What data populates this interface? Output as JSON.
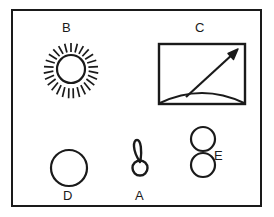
{
  "figure": {
    "title": "",
    "background_color": "#ffffff",
    "stroke_color": "#1a1a1a",
    "frame": {
      "name": "outer-frame",
      "x": 11,
      "y": 9,
      "width": 251,
      "height": 198,
      "border_width": 2
    }
  },
  "labels": {
    "a": "A",
    "b": "B",
    "c": "C",
    "d": "D",
    "e": "E"
  },
  "items": [
    {
      "key": "b",
      "label": "B",
      "icon": "sun-icon",
      "description": "circle with radiating rays",
      "label_position": "above",
      "center_x": 71,
      "center_y": 69,
      "circle_radius": 14,
      "ray_count": 26,
      "ray_inner_radius": 17,
      "ray_outer_radius": 26
    },
    {
      "key": "c",
      "label": "C",
      "icon": "landscape-arrow-panel-icon",
      "description": "rectangle with curved horizon arc and diagonal arrow pointing up-right",
      "label_position": "above",
      "rect_x": 159,
      "rect_y": 44,
      "rect_width": 86,
      "rect_height": 60
    },
    {
      "key": "d",
      "label": "D",
      "icon": "circle-icon",
      "description": "single plain circle outline",
      "label_position": "below",
      "center_x": 69,
      "center_y": 168,
      "radius": 18
    },
    {
      "key": "a",
      "label": "A",
      "icon": "balloon-icon",
      "description": "narrow teardrop loop rising from a small ring",
      "label_position": "below",
      "center_x": 140,
      "center_y": 168,
      "ring_radius": 8
    },
    {
      "key": "e",
      "label": "E",
      "icon": "two-circles-icon",
      "description": "two stacked circle outlines",
      "label_position": "right",
      "upper_center_x": 203,
      "upper_center_y": 139,
      "lower_center_x": 203,
      "lower_center_y": 165,
      "radius": 12
    }
  ]
}
